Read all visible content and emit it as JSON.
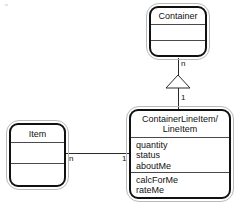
{
  "diagram": {
    "type": "uml-class-diagram",
    "background_color": "#ffffff",
    "line_color": "#2a2a2a",
    "text_color": "#111111",
    "classes": [
      {
        "id": "container",
        "name": "Container",
        "attributes": [],
        "operations": []
      },
      {
        "id": "item",
        "name": "Item",
        "attributes": [],
        "operations": []
      },
      {
        "id": "lineitem",
        "name": "ContainerLineItem/\nLineItem",
        "name_line1": "ContainerLineItem/",
        "name_line2": "LineItem",
        "attributes": [
          "quantity",
          "status",
          "aboutMe"
        ],
        "operations": [
          "calcForMe",
          "rateMe"
        ]
      }
    ],
    "relationships": [
      {
        "id": "generalization",
        "kind": "generalization",
        "from": "lineitem",
        "to": "container",
        "source_multiplicity": "1",
        "target_multiplicity": "n",
        "arrowhead": "hollow-triangle"
      },
      {
        "id": "association",
        "kind": "association",
        "from": "item",
        "to": "lineitem",
        "source_multiplicity": "n",
        "target_multiplicity": "1",
        "arrowhead": "none"
      }
    ]
  }
}
